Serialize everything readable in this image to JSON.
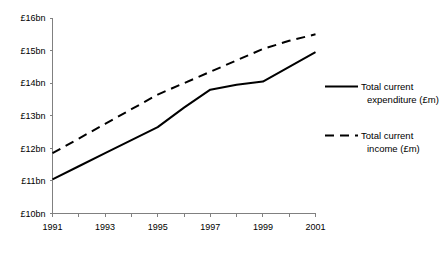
{
  "chart_data": {
    "type": "line",
    "title": "",
    "subtitle": "",
    "xlabel": "",
    "ylabel": "",
    "x": [
      1991,
      1992,
      1993,
      1994,
      1995,
      1996,
      1997,
      1998,
      1999,
      2000,
      2001
    ],
    "x_tick_labels": [
      "1991",
      "1993",
      "1995",
      "1997",
      "1999",
      "2001"
    ],
    "x_tick_values": [
      1991,
      1993,
      1995,
      1997,
      1999,
      2001
    ],
    "xlim": [
      1991,
      2001
    ],
    "ylim": [
      10,
      16
    ],
    "y_tick_labels": [
      "£10bn",
      "£11bn",
      "£12bn",
      "£13bn",
      "£14bn",
      "£15bn",
      "£16bn"
    ],
    "y_tick_values": [
      10,
      11,
      12,
      13,
      14,
      15,
      16
    ],
    "grid": false,
    "legend_position": "right",
    "series": [
      {
        "name": "Total current expenditure (£m)",
        "style": "solid",
        "color": "#000000",
        "values": [
          11.05,
          11.45,
          11.85,
          12.25,
          12.65,
          13.25,
          13.8,
          13.95,
          14.05,
          14.5,
          14.95
        ]
      },
      {
        "name": "Total current income (£m)",
        "style": "dashed",
        "color": "#000000",
        "values": [
          11.85,
          12.3,
          12.75,
          13.2,
          13.65,
          14.0,
          14.35,
          14.7,
          15.05,
          15.3,
          15.5
        ]
      }
    ],
    "legend": [
      {
        "label_line1": "Total current",
        "label_line2": "expenditure (£m)",
        "style": "solid"
      },
      {
        "label_line1": "Total current",
        "label_line2": "income (£m)",
        "style": "dashed"
      }
    ]
  }
}
